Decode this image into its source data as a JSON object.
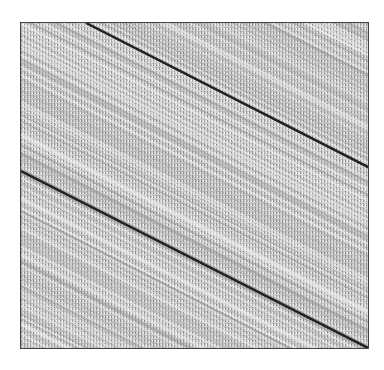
{
  "image": {
    "description": "Grayscale square pattern of fine diagonal striations descending left-to-right, with two dark diagonal lines",
    "frame": {
      "x": 20,
      "y": 22,
      "width": 349,
      "height": 327,
      "border_color": "#444444"
    },
    "background_color": "#c8c8c8",
    "stripe_colors": [
      "#9a9a9a",
      "#e6e6e6",
      "#b4b4b4",
      "#f2f2f2"
    ],
    "dark_lines": [
      {
        "x1": 65,
        "y1": 0,
        "x2": 349,
        "y2": 145,
        "color": "#222222"
      },
      {
        "x1": 0,
        "y1": 148,
        "x2": 347,
        "y2": 325,
        "color": "#222222"
      }
    ]
  }
}
